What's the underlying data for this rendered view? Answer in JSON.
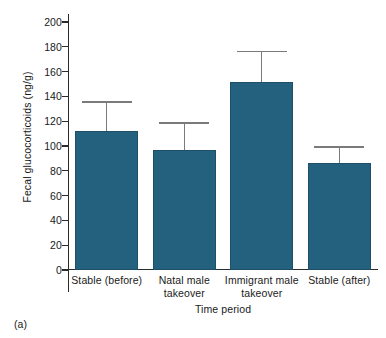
{
  "figure": {
    "panel_caption": "(a)"
  },
  "chart_data": {
    "type": "bar",
    "title": "",
    "xlabel": "Time period",
    "ylabel": "Fecal glucocorticoids (ng/g)",
    "categories": [
      "Stable (before)",
      "Natal male takeover",
      "Immigrant male takeover",
      "Stable (after)"
    ],
    "category_lines": [
      [
        "Stable (before)"
      ],
      [
        "Natal male",
        "takeover"
      ],
      [
        "Immigrant male",
        "takeover"
      ],
      [
        "Stable (after)"
      ]
    ],
    "values": [
      112,
      97,
      152,
      86
    ],
    "error_upper": [
      136,
      119,
      177,
      100
    ],
    "errors": [
      24,
      22,
      25,
      14
    ],
    "ylim": [
      0,
      200
    ],
    "yticks": [
      0,
      20,
      40,
      60,
      80,
      100,
      120,
      140,
      160,
      180,
      200
    ],
    "grid": false,
    "legend": "none",
    "bar_color": "#24617f",
    "error_color": "#7a7a7a",
    "axis_color": "#2b2b2b"
  }
}
